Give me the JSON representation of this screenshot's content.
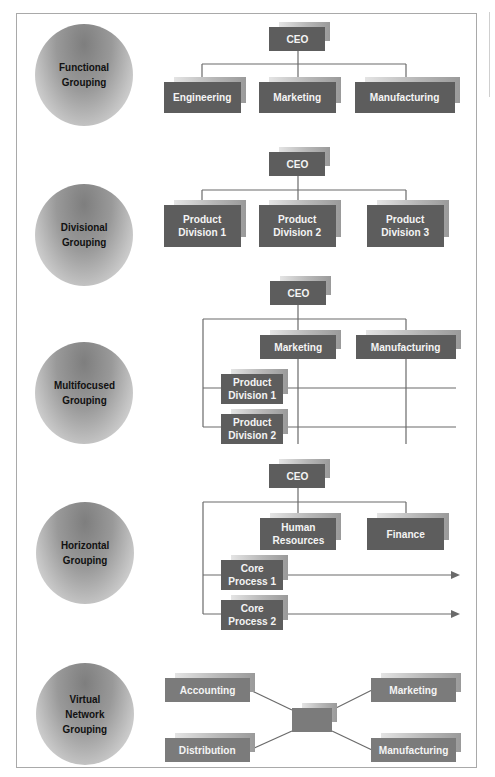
{
  "figure": {
    "rows": [
      {
        "id": "functional",
        "label": "Functional\nGrouping",
        "nodes": {
          "ceo": "CEO",
          "engineering": "Engineering",
          "marketing": "Marketing",
          "manufacturing": "Manufacturing"
        }
      },
      {
        "id": "divisional",
        "label": "Divisional\nGrouping",
        "nodes": {
          "ceo": "CEO",
          "div1": "Product\nDivision 1",
          "div2": "Product\nDivision 2",
          "div3": "Product\nDivision 3"
        }
      },
      {
        "id": "multifocused",
        "label": "Multifocused\nGrouping",
        "nodes": {
          "ceo": "CEO",
          "marketing": "Marketing",
          "manufacturing": "Manufacturing",
          "div1": "Product\nDivision 1",
          "div2": "Product\nDivision 2"
        }
      },
      {
        "id": "horizontal",
        "label": "Horizontal\nGrouping",
        "nodes": {
          "ceo": "CEO",
          "hr": "Human\nResources",
          "finance": "Finance",
          "core1": "Core\nProcess 1",
          "core2": "Core\nProcess 2"
        }
      },
      {
        "id": "virtual",
        "label": "Virtual\nNetwork\nGrouping",
        "nodes": {
          "accounting": "Accounting",
          "marketing": "Marketing",
          "distribution": "Distribution",
          "manufacturing": "Manufacturing",
          "hub": ""
        }
      }
    ]
  },
  "colors": {
    "box": "#5d5d5d",
    "box_light": "#7b7b7b",
    "line": "#6a6a6a",
    "frame": "#a9a9a9",
    "text_on_box": "#f4f4f4"
  }
}
